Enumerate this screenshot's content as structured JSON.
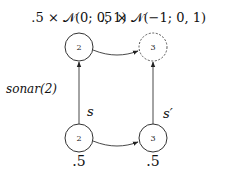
{
  "diagram": {
    "top_labels": {
      "left": ".5 × 𝒩(0; 0, 1)",
      "right": ".5 × 𝒩(−1; 0, 1)"
    },
    "nodes": {
      "top_left": {
        "label": "2",
        "style": "solid"
      },
      "top_right": {
        "label": "3",
        "style": "dashed"
      },
      "bottom_left": {
        "label": "2",
        "style": "solid"
      },
      "bottom_right": {
        "label": "3",
        "style": "solid"
      }
    },
    "edge_labels": {
      "left_vertical": "s",
      "right_vertical": "s′",
      "side_label": "sonar(2)"
    },
    "bottom_labels": {
      "left": ".5",
      "right": ".5"
    },
    "colors": {
      "stroke": "#333333",
      "text": "#111111"
    }
  }
}
